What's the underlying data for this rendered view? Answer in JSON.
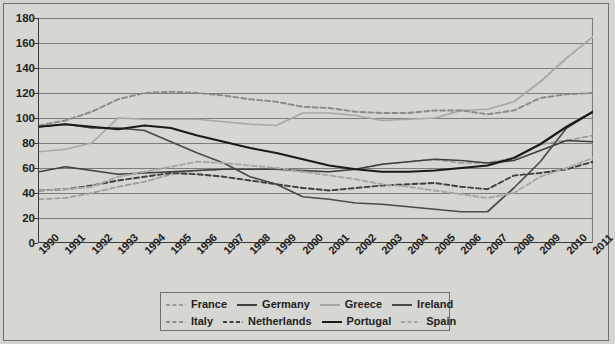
{
  "chart_data": {
    "type": "line",
    "title": "",
    "subtitle": "",
    "xlabel": "",
    "ylabel": "",
    "xlim": [
      1990,
      2011
    ],
    "ylim": [
      0,
      180
    ],
    "ytick_step": 20,
    "grid": true,
    "grid_axis": "y",
    "legend_position": "bottom-center",
    "x": [
      1990,
      1991,
      1992,
      1993,
      1994,
      1995,
      1996,
      1997,
      1998,
      1999,
      2000,
      2001,
      2002,
      2003,
      2004,
      2005,
      2006,
      2007,
      2008,
      2009,
      2010,
      2011
    ],
    "yticks": [
      0,
      20,
      40,
      60,
      80,
      100,
      120,
      140,
      160,
      180
    ],
    "xtick_labels": [
      "1990",
      "1991",
      "1992",
      "1993",
      "1994",
      "1995",
      "1996",
      "1997",
      "1998",
      "1999",
      "2000",
      "2001",
      "2002",
      "2003",
      "2004",
      "2005",
      "2006",
      "2007",
      "2008",
      "2009",
      "2010",
      "2011"
    ],
    "series": [
      {
        "name": "France",
        "style": "dashed",
        "color": "#9a9a96",
        "width": 1.7,
        "values": [
          35,
          36,
          40,
          45,
          49,
          55,
          58,
          59,
          59,
          59,
          57,
          57,
          59,
          63,
          65,
          67,
          64,
          64,
          68,
          79,
          82,
          86
        ]
      },
      {
        "name": "Germany",
        "style": "solid",
        "color": "#3f3f3d",
        "width": 1.7,
        "values": [
          57,
          61,
          58,
          55,
          56,
          57,
          58,
          59,
          59,
          59,
          58,
          57,
          59,
          63,
          65,
          67,
          66,
          64,
          66,
          74,
          82,
          81
        ]
      },
      {
        "name": "Greece",
        "style": "solid",
        "color": "#a7a7a3",
        "width": 1.7,
        "values": [
          73,
          75,
          80,
          100,
          99,
          99,
          99,
          97,
          95,
          94,
          104,
          104,
          102,
          98,
          99,
          100,
          106,
          107,
          113,
          129,
          148,
          165
        ]
      },
      {
        "name": "Ireland",
        "style": "solid",
        "color": "#4a4a48",
        "width": 1.7,
        "values": [
          93,
          95,
          92,
          92,
          90,
          81,
          72,
          64,
          53,
          47,
          37,
          35,
          32,
          31,
          29,
          27,
          25,
          25,
          44,
          65,
          92,
          105
        ]
      },
      {
        "name": "Italy",
        "style": "dashed",
        "color": "#8a8a86",
        "width": 1.9,
        "values": [
          94,
          98,
          105,
          115,
          120,
          121,
          120,
          118,
          115,
          113,
          109,
          108,
          105,
          104,
          104,
          106,
          106,
          103,
          106,
          116,
          119,
          120
        ]
      },
      {
        "name": "Netherlands",
        "style": "dashed",
        "color": "#3f3f3d",
        "width": 1.9,
        "values": [
          42,
          43,
          46,
          50,
          53,
          56,
          55,
          53,
          50,
          47,
          44,
          42,
          44,
          46,
          47,
          48,
          45,
          43,
          54,
          56,
          59,
          65
        ]
      },
      {
        "name": "Portugal",
        "style": "solid",
        "color": "#1a1a18",
        "width": 2.2,
        "values": [
          93,
          95,
          93,
          91,
          94,
          92,
          86,
          81,
          76,
          72,
          67,
          62,
          59,
          57,
          57,
          58,
          60,
          62,
          68,
          79,
          93,
          105
        ]
      },
      {
        "name": "Spain",
        "style": "dashed",
        "color": "#a7a7a3",
        "width": 1.9,
        "values": [
          42,
          43,
          45,
          53,
          57,
          61,
          65,
          64,
          62,
          60,
          57,
          54,
          51,
          47,
          45,
          42,
          39,
          36,
          40,
          53,
          60,
          68
        ]
      }
    ]
  },
  "legend": {
    "row1": [
      {
        "label": "France",
        "style": "dashed",
        "color": "#9a9a96"
      },
      {
        "label": "Germany",
        "style": "solid",
        "color": "#3f3f3d"
      },
      {
        "label": "Greece",
        "style": "solid",
        "color": "#a7a7a3"
      },
      {
        "label": "Ireland",
        "style": "solid",
        "color": "#4a4a48"
      }
    ],
    "row2": [
      {
        "label": "Italy",
        "style": "dashed",
        "color": "#8a8a86"
      },
      {
        "label": "Netherlands",
        "style": "dashed",
        "color": "#3f3f3d"
      },
      {
        "label": "Portugal",
        "style": "solid",
        "color": "#1a1a18"
      },
      {
        "label": "Spain",
        "style": "dashed",
        "color": "#a7a7a3"
      }
    ]
  },
  "colors": {
    "background": "#d6d6d2",
    "frame": "#6f6f6b",
    "axis": "#3a3a38",
    "gridline": "#7d7d79",
    "text": "#231f20"
  }
}
